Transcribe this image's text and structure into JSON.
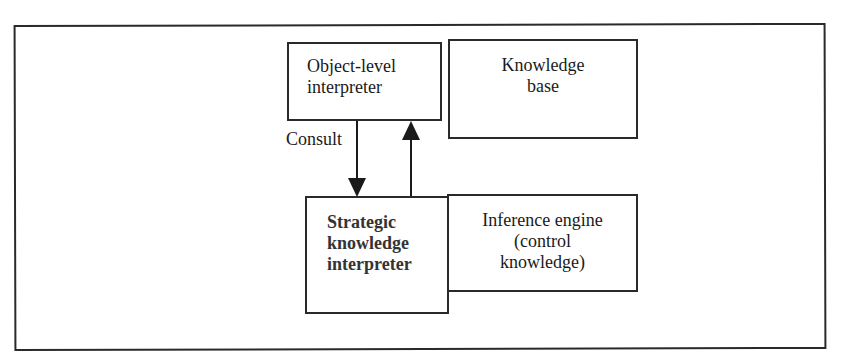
{
  "diagram": {
    "type": "block-diagram",
    "boxes": [
      {
        "id": "object-level-interpreter",
        "label": "Object-level\ninterpreter"
      },
      {
        "id": "knowledge-base",
        "label": "Knowledge\nbase"
      },
      {
        "id": "strategic-knowledge-interpreter",
        "label": "Strategic\nknowledge\ninterpreter"
      },
      {
        "id": "inference-engine",
        "label": "Inference engine\n(control\nknowledge)"
      }
    ],
    "edges": [
      {
        "from": "object-level-interpreter",
        "to": "strategic-knowledge-interpreter",
        "label": "Consult"
      },
      {
        "from": "strategic-knowledge-interpreter",
        "to": "object-level-interpreter",
        "label": ""
      }
    ],
    "consult_label": "Consult",
    "stroke_color": "#2a2a2a",
    "background_color": "#ffffff"
  }
}
